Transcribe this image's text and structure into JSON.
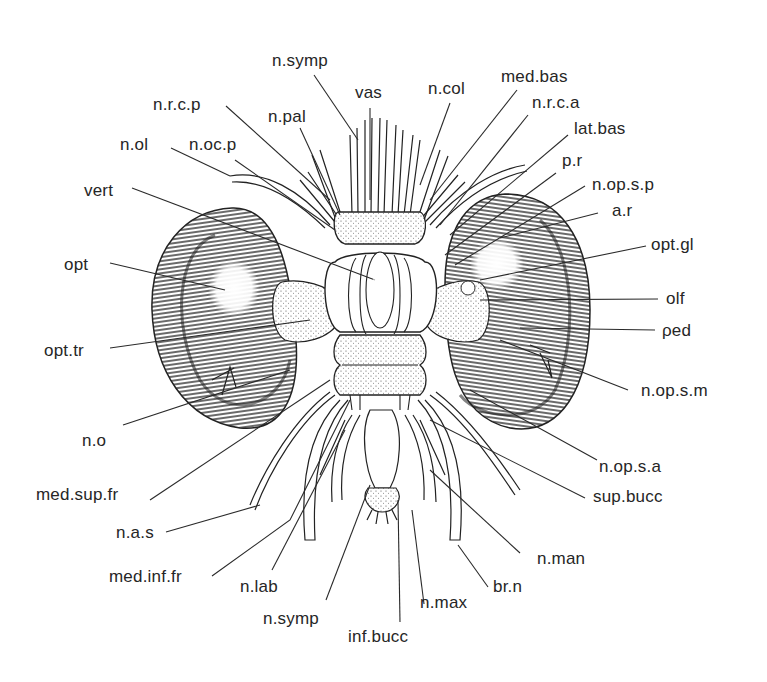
{
  "figure": {
    "colors": {
      "ink": "#262626",
      "paper": "#ffffff",
      "eye_shading": "#3a3a3a"
    }
  },
  "labels": {
    "n_symp_top": "n.symp",
    "vas": "vas",
    "n_col": "n.col",
    "med_bas": "med.bas",
    "n_r_c_p": "n.r.c.p",
    "n_pal": "n.pal",
    "n_r_c_a": "n.r.c.a",
    "lat_bas": "lat.bas",
    "n_ol": "n.ol",
    "n_oc_p": "n.oc.p",
    "p_r": "p.r",
    "vert": "vert",
    "n_op_s_p": "n.op.s.p",
    "a_r": "a.r",
    "opt": "opt",
    "opt_gl": "opt.gl",
    "olf": "olf",
    "opt_tr": "opt.tr",
    "ped": "ρed",
    "n_op_s_m": "n.op.s.m",
    "n_o": "n.o",
    "n_op_s_a": "n.op.s.a",
    "med_sup_fr": "med.sup.fr",
    "sup_bucc": "sup.bucc",
    "n_a_s": "n.a.s",
    "n_man": "n.man",
    "med_inf_fr": "med.inf.fr",
    "n_lab": "n.lab",
    "br_n": "br.n",
    "n_symp_bottom": "n.symp",
    "n_max": "n.max",
    "inf_bucc": "inf.bucc"
  }
}
